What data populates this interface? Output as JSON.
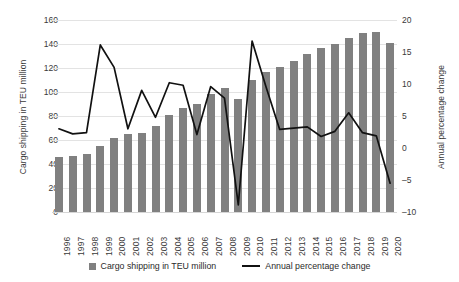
{
  "chart_data": {
    "type": "bar",
    "title": "",
    "xlabel": "",
    "ylabel": "Cargo shipping in TEU million",
    "y2label": "Annual percentage change",
    "grid": true,
    "legend_position": "bottom",
    "categories": [
      "1996",
      "1997",
      "1998",
      "1999",
      "2000",
      "2001",
      "2002",
      "2003",
      "2004",
      "2005",
      "2006",
      "2007",
      "2008",
      "2009",
      "2010",
      "2011",
      "2012",
      "2013",
      "2014",
      "2015",
      "2016",
      "2017",
      "2018",
      "2019",
      "2020"
    ],
    "ylim": [
      0,
      160
    ],
    "yticks": [
      0,
      20,
      40,
      60,
      80,
      100,
      120,
      140,
      160
    ],
    "y2lim": [
      -10,
      20
    ],
    "y2ticks": [
      -10,
      -5,
      0,
      5,
      10,
      15,
      20
    ],
    "series": [
      {
        "name": "Cargo shipping in TEU million",
        "type": "bar",
        "axis": "left",
        "color": "#808080",
        "values": [
          46.0,
          47.0,
          48.0,
          55.0,
          62.0,
          65.0,
          65.5,
          72.0,
          81.0,
          87.0,
          90.0,
          98.0,
          103.0,
          94.0,
          110.0,
          117.0,
          121.0,
          126.0,
          132.0,
          136.5,
          140.0,
          145.0,
          149.5,
          150.0,
          141.0
        ]
      },
      {
        "name": "Annual percentage change",
        "type": "line",
        "axis": "right",
        "color": "#111111",
        "values": [
          3.0,
          2.2,
          2.4,
          16.1,
          12.6,
          3.0,
          9.0,
          4.8,
          10.2,
          9.8,
          2.1,
          9.6,
          7.8,
          -8.9,
          16.7,
          9.6,
          2.9,
          3.1,
          3.3,
          1.8,
          2.6,
          5.5,
          2.4,
          1.9,
          -5.5
        ]
      }
    ]
  },
  "legend": {
    "items": [
      {
        "label": "Cargo shipping in TEU million",
        "marker": "square-swatch",
        "color": "#808080"
      },
      {
        "label": "Annual percentage change",
        "marker": "line-swatch",
        "color": "#111111"
      }
    ]
  },
  "axes": {
    "left_title": "Cargo shipping in TEU million",
    "right_title": "Annual percentage change"
  }
}
